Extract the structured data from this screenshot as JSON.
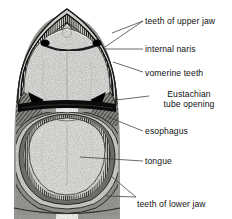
{
  "figure": {
    "name": "frog-mouth-anatomy",
    "style": "grayscale stippled pen-and-ink biological illustration",
    "background_color": "#ffffff",
    "ink_color": "#111111",
    "palette": {
      "paper": "#ffffff",
      "pale_tissue": "#e9e9e7",
      "light_tissue": "#dcdcd8",
      "mid_gray": "#9c9c98",
      "dark_gray": "#5a5a58",
      "near_black": "#111111"
    }
  },
  "labels": [
    {
      "id": "teeth-upper-jaw",
      "text": "teeth of upper jaw",
      "x": 145,
      "y": 17,
      "lines": 1
    },
    {
      "id": "internal-naris",
      "text": "internal naris",
      "x": 145,
      "y": 45,
      "lines": 1
    },
    {
      "id": "vomerine-teeth",
      "text": "vomerine teeth",
      "x": 145,
      "y": 69,
      "lines": 1
    },
    {
      "id": "eustachian-tube",
      "text": "Eustachian tube opening",
      "line1": "Eustachian",
      "line2": "tube opening",
      "x": 152,
      "y": 90,
      "lines": 2
    },
    {
      "id": "esophagus",
      "text": "esophagus",
      "x": 145,
      "y": 127,
      "lines": 1
    },
    {
      "id": "tongue",
      "text": "tongue",
      "x": 145,
      "y": 157,
      "lines": 1
    },
    {
      "id": "teeth-lower-jaw",
      "text": "teeth of lower jaw",
      "x": 137,
      "y": 200,
      "lines": 1
    }
  ],
  "structures": [
    {
      "id": "upper-jaw-tooth-row",
      "description": "hatched dark arc of maxillary teeth along the upper jaw margin"
    },
    {
      "id": "internal-naris-left",
      "description": "solid black oval opening, left side",
      "cx": 45,
      "cy": 44
    },
    {
      "id": "internal-naris-right",
      "description": "solid black oval opening, right side",
      "cx": 97,
      "cy": 44
    },
    {
      "id": "vomerine-teeth-arc",
      "description": "thin dark arc of vomerine teeth between the nares"
    },
    {
      "id": "palate",
      "description": "large pale stippled roof of the mouth"
    },
    {
      "id": "eustachian-opening-left",
      "description": "dark triangular opening, left",
      "cx": 37,
      "cy": 97
    },
    {
      "id": "eustachian-opening-right",
      "description": "dark triangular opening, right",
      "cx": 110,
      "cy": 97
    },
    {
      "id": "esophagus",
      "description": "dark pharyngeal slit behind the tongue"
    },
    {
      "id": "tongue",
      "description": "large pale shield-shaped tongue filling the lower mouth"
    },
    {
      "id": "lower-jaw-rings",
      "description": "concentric dark rings of the lower jaw margin"
    }
  ]
}
